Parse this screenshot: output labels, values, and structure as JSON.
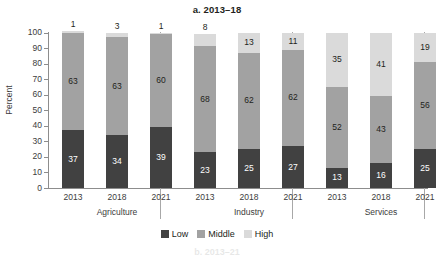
{
  "chart_data": {
    "type": "bar",
    "subtype": "stacked-column-100",
    "title": "a. 2013–18",
    "xlabel": "",
    "ylabel": "Percent",
    "ylim": [
      0,
      100
    ],
    "yticks": [
      0,
      10,
      20,
      30,
      40,
      50,
      60,
      70,
      80,
      90,
      100
    ],
    "grid": false,
    "legend_position": "bottom-center",
    "categories": [
      "2013",
      "2018",
      "2021",
      "2013",
      "2018",
      "2021",
      "2013",
      "2018",
      "2021"
    ],
    "groups": [
      {
        "name": "Agriculture",
        "categories": [
          "2013",
          "2018",
          "2021"
        ],
        "values": {
          "Low": [
            37,
            34,
            39
          ],
          "Middle": [
            63,
            63,
            60
          ],
          "High": [
            1,
            3,
            1
          ]
        }
      },
      {
        "name": "Industry",
        "categories": [
          "2013",
          "2018",
          "2021"
        ],
        "values": {
          "Low": [
            23,
            25,
            27
          ],
          "Middle": [
            68,
            62,
            62
          ],
          "High": [
            8,
            13,
            11
          ]
        }
      },
      {
        "name": "Services",
        "categories": [
          "2013",
          "2018",
          "2021"
        ],
        "values": {
          "Low": [
            13,
            16,
            25
          ],
          "Middle": [
            52,
            43,
            56
          ],
          "High": [
            35,
            41,
            19
          ]
        }
      }
    ],
    "series": [
      {
        "name": "Low",
        "color": "#414141",
        "values": [
          37,
          34,
          39,
          23,
          25,
          27,
          13,
          16,
          25
        ]
      },
      {
        "name": "Middle",
        "color": "#a2a2a2",
        "values": [
          63,
          63,
          60,
          68,
          62,
          62,
          52,
          43,
          56
        ]
      },
      {
        "name": "High",
        "color": "#dadada",
        "values": [
          1,
          3,
          1,
          8,
          13,
          11,
          35,
          41,
          19
        ]
      }
    ]
  },
  "legend": {
    "items": [
      {
        "label": "Low",
        "color": "#414141"
      },
      {
        "label": "Middle",
        "color": "#a2a2a2"
      },
      {
        "label": "High",
        "color": "#dadada"
      }
    ]
  },
  "axis": {
    "y_title": "Percent",
    "y_ticks": [
      "100",
      "90",
      "80",
      "70",
      "60",
      "50",
      "40",
      "30",
      "20",
      "10",
      "0"
    ]
  },
  "group_labels": [
    "Agriculture",
    "Industry",
    "Services"
  ],
  "x_labels": [
    "2013",
    "2018",
    "2021",
    "2013",
    "2018",
    "2021",
    "2013",
    "2018",
    "2021"
  ],
  "next_panel_title": "b. 2013–21"
}
